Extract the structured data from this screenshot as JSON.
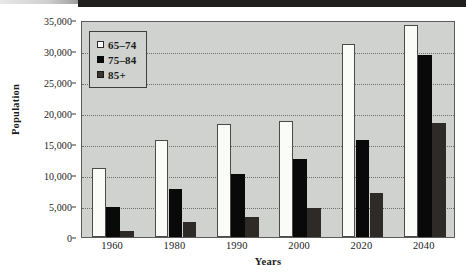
{
  "figure": {
    "y_axis_title": "Population",
    "x_axis_title": "Years",
    "plot_background": "#cfd2cf",
    "frame_color": "#5a5c5a"
  },
  "legend": {
    "entries": [
      {
        "label": "65–74",
        "color": "#ffffff",
        "swatch": "white-square-icon"
      },
      {
        "label": "75–84",
        "color": "#090909",
        "swatch": "black-square-icon"
      },
      {
        "label": "85+",
        "color": "#3a3634",
        "swatch": "dark-gray-square-icon"
      }
    ]
  },
  "chart_data": {
    "type": "bar",
    "title": "",
    "xlabel": "Years",
    "ylabel": "Population",
    "categories": [
      "1960",
      "1980",
      "1990",
      "2000",
      "2020",
      "2040"
    ],
    "series": [
      {
        "name": "65–74",
        "color": "#ffffff",
        "values": [
          11200,
          15700,
          18200,
          18700,
          31100,
          34200
        ]
      },
      {
        "name": "75–84",
        "color": "#090909",
        "values": [
          4800,
          7800,
          10200,
          12600,
          15700,
          29300
        ]
      },
      {
        "name": "85+",
        "color": "#3a3634",
        "values": [
          1000,
          2400,
          3200,
          4600,
          7100,
          18400
        ]
      }
    ],
    "ylim": [
      0,
      35000
    ],
    "ytick_values": [
      0,
      5000,
      10000,
      15000,
      20000,
      25000,
      30000,
      35000
    ],
    "ytick_labels": [
      "0",
      "5,000",
      "10,000",
      "15,000",
      "20,000",
      "25,000",
      "30,000",
      "35,000"
    ],
    "grid": true,
    "grid_axis": "y",
    "legend_position": "upper-left-inside"
  }
}
